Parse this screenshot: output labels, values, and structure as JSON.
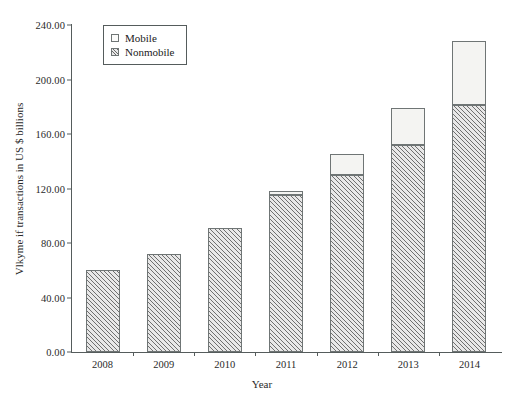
{
  "chart_data": {
    "type": "bar",
    "subtype": "stacked",
    "title": "",
    "xlabel": "Year",
    "ylabel": "Vlkyme if transactions in US $ billions",
    "categories": [
      "2008",
      "2009",
      "2010",
      "2011",
      "2012",
      "2013",
      "2014"
    ],
    "series": [
      {
        "name": "Nonmobile",
        "values": [
          60,
          72,
          91,
          115,
          130,
          152,
          181
        ],
        "fill": "hatched-diagonal",
        "color": "#e8e8e8"
      },
      {
        "name": "Mobile",
        "values": [
          0,
          0,
          0,
          3,
          15,
          27,
          47
        ],
        "fill": "solid-white",
        "color": "#f4f4f2"
      }
    ],
    "totals": [
      60,
      72,
      91,
      118,
      145,
      179,
      228
    ],
    "ylim": [
      0,
      240
    ],
    "yticks": [
      "0.00",
      "40.00",
      "80.00",
      "120.00",
      "160.00",
      "200.00",
      "240.00"
    ],
    "ytick_values": [
      0,
      40,
      80,
      120,
      160,
      200,
      240
    ],
    "grid": false,
    "legend_position": "top-left",
    "legend_entries": [
      "Mobile",
      "Nonmobile"
    ],
    "axis_color": "#555c5c"
  }
}
